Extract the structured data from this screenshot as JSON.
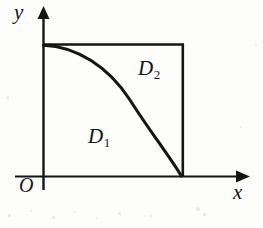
{
  "figure": {
    "background_color": "#fdfdfc",
    "ink_color": "#151515",
    "axes": {
      "y_label": "y",
      "x_label": "x",
      "origin_label": "O",
      "x_axis": {
        "y_px": 176,
        "x_start_px": 15,
        "x_end_px": 248,
        "arrow": true
      },
      "y_axis": {
        "x_px": 43,
        "y_start_px": 190,
        "y_end_px": 8,
        "arrow": true
      }
    },
    "rectangle": {
      "top_left_px": [
        43,
        44
      ],
      "top_right_px": [
        183,
        44
      ],
      "bottom_right_px": [
        183,
        176
      ],
      "bottom_left_px": [
        43,
        176
      ],
      "drawn_edges": [
        "top",
        "right"
      ]
    },
    "curve": {
      "description": "decreasing concave curve from the y-axis top corner to the x-axis foot of the right edge",
      "start_px": [
        43,
        44
      ],
      "end_px": [
        182,
        176
      ],
      "start_tangent": "horizontal",
      "end_tangent": "vertical",
      "stroke_width_px": 3,
      "path": "M 43.5,45 C 78,46.5 112,69 134,105 C 152,134 170,158 181.5,176"
    },
    "regions": [
      {
        "id": "D1",
        "label": "D",
        "subscript": "1",
        "position_px": [
          88,
          126
        ],
        "meaning": "region below and left of the curve"
      },
      {
        "id": "D2",
        "label": "D",
        "subscript": "2",
        "position_px": [
          138,
          58
        ],
        "meaning": "region above and right of the curve inside the rectangle"
      }
    ],
    "scan_specks": [
      {
        "x_px": 8,
        "y_px": 214,
        "size_px": 3
      },
      {
        "x_px": 30,
        "y_px": 210,
        "size_px": 2
      },
      {
        "x_px": 52,
        "y_px": 216,
        "size_px": 3
      },
      {
        "x_px": 74,
        "y_px": 211,
        "size_px": 2
      },
      {
        "x_px": 96,
        "y_px": 217,
        "size_px": 2
      },
      {
        "x_px": 118,
        "y_px": 212,
        "size_px": 3
      },
      {
        "x_px": 150,
        "y_px": 215,
        "size_px": 2
      },
      {
        "x_px": 196,
        "y_px": 207,
        "size_px": 4
      },
      {
        "x_px": 203,
        "y_px": 213,
        "size_px": 3
      },
      {
        "x_px": 6,
        "y_px": 96,
        "size_px": 3
      },
      {
        "x_px": 240,
        "y_px": 126,
        "size_px": 2
      },
      {
        "x_px": 255,
        "y_px": 44,
        "size_px": 2
      }
    ]
  }
}
